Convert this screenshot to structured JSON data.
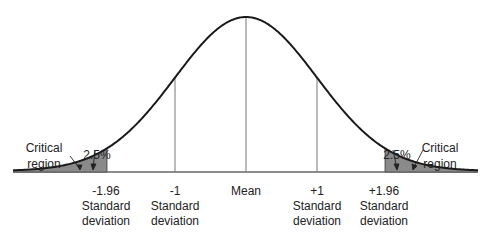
{
  "diagram": {
    "type": "normal-distribution",
    "colors": {
      "curve": "#1a1a1a",
      "tail_fill": "#8a8a8a",
      "lines": "#777777",
      "background": "#ffffff"
    },
    "left_callout": {
      "title_line1": "Critical",
      "title_line2": "region",
      "percent": "2.5%"
    },
    "right_callout": {
      "title_line1": "Critical",
      "title_line2": "region",
      "percent": "2.5%"
    },
    "axis_labels": [
      {
        "value": "-1.96",
        "line2": "Standard",
        "line3": "deviation"
      },
      {
        "value": "-1",
        "line2": "Standard",
        "line3": "deviation"
      },
      {
        "value": "Mean",
        "line2": "",
        "line3": ""
      },
      {
        "value": "+1",
        "line2": "Standard",
        "line3": "deviation"
      },
      {
        "value": "+1.96",
        "line2": "Standard",
        "line3": "deviation"
      }
    ]
  }
}
